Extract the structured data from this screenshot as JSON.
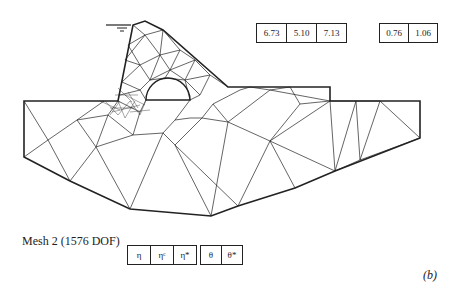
{
  "figure": {
    "caption": "Mesh 2 (1576 DOF)",
    "panel_label": "(b)"
  },
  "top_boxes": {
    "group1": [
      "6.73",
      "5.10",
      "7.13"
    ],
    "group2": [
      "0.76",
      "1.06"
    ]
  },
  "bottom_boxes": {
    "group1": [
      "η",
      "ηᶜ",
      "η*"
    ],
    "group2": [
      "θ",
      "θ*"
    ]
  },
  "colors": {
    "line": "#222222",
    "background": "#ffffff"
  }
}
